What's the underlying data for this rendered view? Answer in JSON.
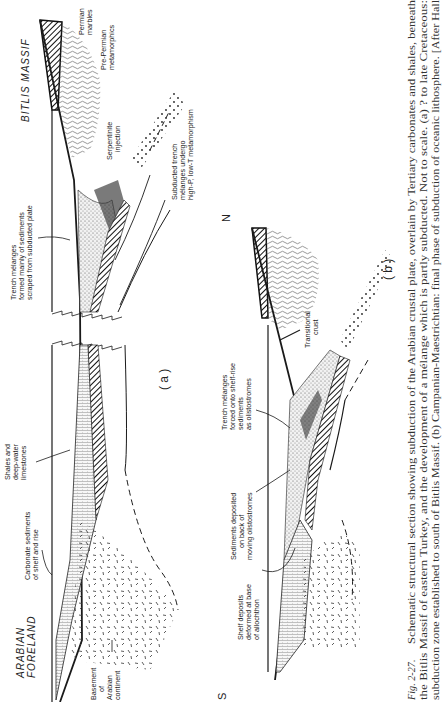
{
  "figure": {
    "number": "Fig. 2-27.",
    "caption_lines": [
      "Schematic structural section showing subduction of the Arabian crustal plate, overlain by Tertiary carbonates and shales, beneath",
      "the Bitlis Massif of eastern Turkey, and the development of a mélange which is partly subducted. Not to scale. (a) ? to late Cretaceous:",
      "subduction zone established to south of Bitlis Massif. (b) Campanian-Maestrichtian: final phase of subduction of oceanic lithosphere. [After Hall"
    ]
  },
  "panel_a": {
    "label": "( a )",
    "region_north": "BITLIS  MASSIF",
    "region_south": [
      "ARABIAN",
      "FORELAND"
    ],
    "annotations": {
      "permian_marbles": [
        "Permian",
        "marbles"
      ],
      "pre_permian": [
        "Pre-Permian",
        "metamorphics"
      ],
      "serpentinite": [
        "Serpentinite",
        "injection"
      ],
      "subducted_trench": [
        "Subducted trench",
        "mélanges undergo",
        "high-P, low-T metamorphism"
      ],
      "trench_melanges": [
        "Trench mélanges",
        "formed mainly of sediments",
        "scraped from subducted plate"
      ],
      "shales": [
        "Shales and",
        "deep-water",
        "limestones"
      ],
      "carbonate": [
        "Carbonate sediments",
        "of shelf and rise"
      ],
      "basement": [
        "Basement",
        "of",
        "Arabian",
        "continent"
      ]
    }
  },
  "panel_b": {
    "label": "( b )",
    "dir_north": "N",
    "dir_south": "S",
    "annotations": {
      "transitional": [
        "Transitional",
        "crust"
      ],
      "trench_melanges": [
        "Trench mélanges",
        "forced onto shelf-rise",
        "sediments",
        "as olistostromes"
      ],
      "sediments_deposited": [
        "Sediments deposited",
        "on back of",
        "moving olistostromes"
      ],
      "shelf_deposits": [
        "Shelf deposits",
        "deformed at base",
        "of allochthon"
      ]
    }
  }
}
